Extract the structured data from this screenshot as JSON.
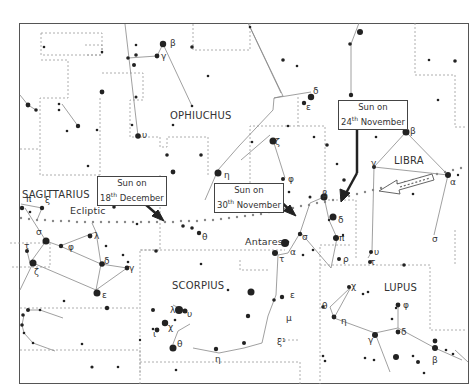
{
  "constellations": [
    {
      "id": "ophiuchus",
      "label": "OPHIUCHUS",
      "x": 170,
      "y": 110
    },
    {
      "id": "sagittarius",
      "label": "SAGITTARIUS",
      "x": 22,
      "y": 189
    },
    {
      "id": "libra",
      "label": "LIBRA",
      "x": 394,
      "y": 155
    },
    {
      "id": "scorpius",
      "label": "SCORPIUS",
      "x": 172,
      "y": 280
    },
    {
      "id": "lupus",
      "label": "LUPUS",
      "x": 384,
      "y": 282
    }
  ],
  "labels": {
    "ecliptic": "Ecliptic",
    "antares": "Antares"
  },
  "sun_positions": [
    {
      "line1": "Sun on",
      "day": "18",
      "suffix": "th",
      "month": "December",
      "x": 97,
      "y": 176
    },
    {
      "line1": "Sun on",
      "day": "30",
      "suffix": "th",
      "month": "November",
      "x": 215,
      "y": 183
    },
    {
      "line1": "Sun on",
      "day": "24",
      "suffix": "th",
      "month": "November",
      "x": 338,
      "y": 100
    }
  ],
  "greek_letters": [
    {
      "t": "β",
      "x": 170,
      "y": 39
    },
    {
      "t": "γ",
      "x": 161,
      "y": 52
    },
    {
      "t": "υ",
      "x": 142,
      "y": 131
    },
    {
      "t": "η",
      "x": 224,
      "y": 171
    },
    {
      "t": "δ",
      "x": 313,
      "y": 87
    },
    {
      "t": "ε",
      "x": 306,
      "y": 103
    },
    {
      "t": "ζ",
      "x": 275,
      "y": 138
    },
    {
      "t": "φ",
      "x": 288,
      "y": 175
    },
    {
      "t": "β",
      "x": 410,
      "y": 127
    },
    {
      "t": "γ",
      "x": 371,
      "y": 159
    },
    {
      "t": "α",
      "x": 450,
      "y": 178
    },
    {
      "t": "β",
      "x": 322,
      "y": 190
    },
    {
      "t": "δ",
      "x": 338,
      "y": 216
    },
    {
      "t": "π",
      "x": 339,
      "y": 234
    },
    {
      "t": "σ",
      "x": 302,
      "y": 233
    },
    {
      "t": "α",
      "x": 290,
      "y": 248
    },
    {
      "t": "τ",
      "x": 279,
      "y": 255
    },
    {
      "t": "ρ",
      "x": 343,
      "y": 255
    },
    {
      "t": "υ",
      "x": 374,
      "y": 248
    },
    {
      "t": "τ",
      "x": 370,
      "y": 258
    },
    {
      "t": "σ",
      "x": 432,
      "y": 235
    },
    {
      "t": "θ",
      "x": 202,
      "y": 233
    },
    {
      "t": "ε",
      "x": 290,
      "y": 291
    },
    {
      "t": "μ",
      "x": 286,
      "y": 314
    },
    {
      "t": "ξ¹",
      "x": 277,
      "y": 338
    },
    {
      "t": "χ",
      "x": 351,
      "y": 282
    },
    {
      "t": "θ",
      "x": 322,
      "y": 302
    },
    {
      "t": "η",
      "x": 341,
      "y": 317
    },
    {
      "t": "γ",
      "x": 368,
      "y": 336
    },
    {
      "t": "δ",
      "x": 401,
      "y": 328
    },
    {
      "t": "φ",
      "x": 403,
      "y": 301
    },
    {
      "t": "β",
      "x": 432,
      "y": 356
    },
    {
      "t": "π",
      "x": 26,
      "y": 195
    },
    {
      "t": "ξ",
      "x": 45,
      "y": 196
    },
    {
      "t": "σ",
      "x": 36,
      "y": 228
    },
    {
      "t": "τ",
      "x": 24,
      "y": 242
    },
    {
      "t": "φ",
      "x": 68,
      "y": 243
    },
    {
      "t": "λ",
      "x": 94,
      "y": 232
    },
    {
      "t": "δ",
      "x": 104,
      "y": 257
    },
    {
      "t": "γ",
      "x": 129,
      "y": 264
    },
    {
      "t": "ζ",
      "x": 34,
      "y": 268
    },
    {
      "t": "ε",
      "x": 102,
      "y": 291
    },
    {
      "t": "λ",
      "x": 170,
      "y": 306
    },
    {
      "t": "υ",
      "x": 187,
      "y": 310
    },
    {
      "t": "χ",
      "x": 168,
      "y": 323
    },
    {
      "t": "ι",
      "x": 153,
      "y": 330
    },
    {
      "t": "θ",
      "x": 177,
      "y": 340
    },
    {
      "t": "η",
      "x": 215,
      "y": 355
    }
  ],
  "chart_data": {
    "type": "star_map",
    "constellations": [
      "OPHIUCHUS",
      "SAGITTARIUS",
      "LIBRA",
      "SCORPIUS",
      "LUPUS"
    ],
    "annotations": [
      "Ecliptic",
      "Antares",
      "Sun on 24th November",
      "Sun on 30th November",
      "Sun on 18th December"
    ],
    "direction": "Sun moves right to left (west to east) along the dotted ecliptic"
  }
}
